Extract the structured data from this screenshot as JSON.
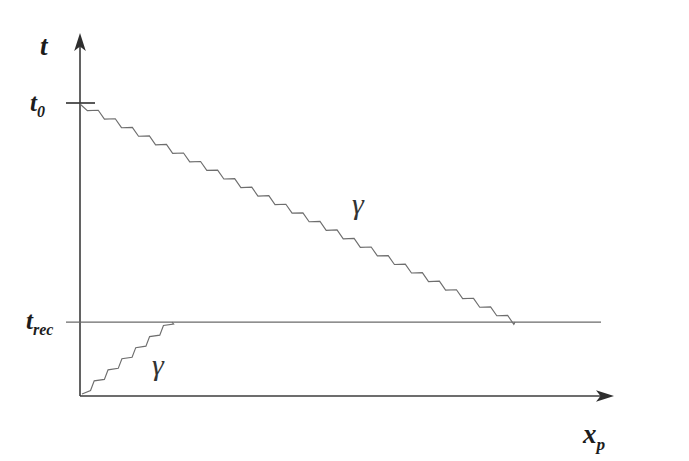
{
  "figure": {
    "kind": "spacetime-diagram",
    "background_color": "#ffffff",
    "ink_color": "#3c3c3c",
    "line_color": "#6e6e6e",
    "axes": {
      "vertical": {
        "label": "t",
        "label_main": "t",
        "label_sub": "",
        "name": "time-axis",
        "x": 80,
        "y_top": 35,
        "y_bottom": 396,
        "arrow": "up"
      },
      "horizontal": {
        "label_main": "x",
        "label_sub": "p",
        "name": "comoving-position-axis",
        "y": 396,
        "x_left": 80,
        "x_right": 612,
        "arrow": "right"
      }
    },
    "ticks": [
      {
        "name": "tick-t0",
        "label_main": "t",
        "label_sub": "0",
        "axis": "vertical",
        "y": 103,
        "label_x": 30,
        "label_y": 110
      },
      {
        "name": "tick-trec",
        "label_main": "t",
        "label_sub": "rec",
        "axis": "vertical",
        "y": 322,
        "label_x": 24,
        "label_y": 329
      }
    ],
    "recombination_line": {
      "name": "recombination-surface-line",
      "y": 322,
      "x_start": 80,
      "x_end": 601
    },
    "worldlines": [
      {
        "name": "photon-worldline-incoming",
        "symbol": "γ",
        "direction": "descending",
        "x_start": 80,
        "y_start": 104,
        "x_end": 515,
        "y_end": 322,
        "style": "wavy",
        "label_x": 358,
        "label_y": 212
      },
      {
        "name": "photon-worldline-outgoing",
        "symbol": "γ",
        "direction": "ascending",
        "x_start": 82,
        "y_start": 394,
        "x_end": 172,
        "y_end": 322,
        "style": "wavy",
        "label_x": 158,
        "label_y": 372
      }
    ]
  },
  "chart_data": {
    "type": "line",
    "title": "",
    "xlabel": "x_p",
    "ylabel": "t",
    "grid": false,
    "legend": "none",
    "xtick_labels": [],
    "ytick_labels": [
      "t_0",
      "t_rec"
    ],
    "ytick_positions": [
      103,
      322
    ],
    "annotations": [
      "γ",
      "γ"
    ],
    "series": [
      {
        "name": "photon-incoming",
        "label": "γ",
        "style": "wavy",
        "x": [
          80,
          515
        ],
        "y": [
          104,
          322
        ]
      },
      {
        "name": "photon-outgoing",
        "label": "γ",
        "style": "wavy",
        "x": [
          82,
          172
        ],
        "y": [
          394,
          322
        ]
      },
      {
        "name": "recombination-surface",
        "label": "t_rec",
        "style": "straight",
        "x": [
          80,
          601
        ],
        "y": [
          322,
          322
        ]
      }
    ]
  }
}
